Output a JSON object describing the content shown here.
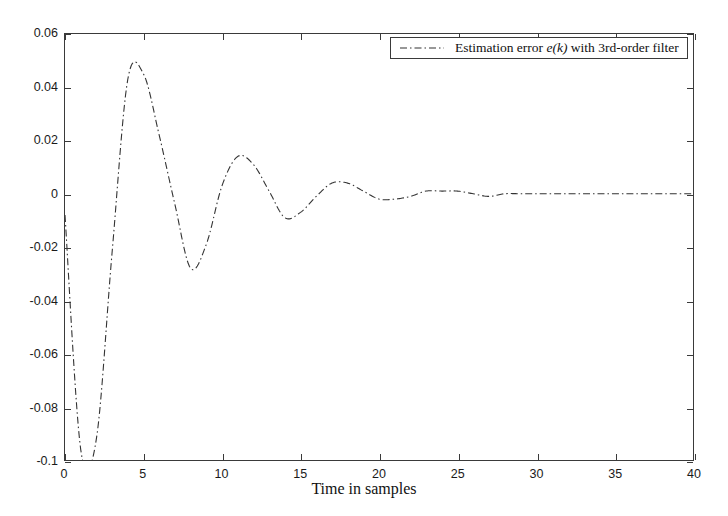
{
  "chart_data": {
    "type": "line",
    "title": "",
    "xlabel": "Time in samples",
    "ylabel": "",
    "xlim": [
      0,
      40
    ],
    "ylim": [
      -0.1,
      0.06
    ],
    "grid": false,
    "legend_position": "top-right",
    "line_style": "dash-dot",
    "line_color": "#333333",
    "background_color": "#ffffff",
    "axis_color": "#3a3a3a",
    "xticks": [
      0,
      5,
      10,
      15,
      20,
      25,
      30,
      35,
      40
    ],
    "xtick_labels": [
      "0",
      "5",
      "10",
      "15",
      "20",
      "25",
      "30",
      "35",
      "40"
    ],
    "yticks": [
      0.06,
      0.04,
      0.02,
      0,
      -0.02,
      -0.04,
      -0.06,
      -0.08,
      -0.1
    ],
    "ytick_labels": [
      "0.06",
      "0.04",
      "0.02",
      "0",
      "-0.02",
      "-0.04",
      "-0.06",
      "-0.08",
      "-0.1"
    ],
    "series": [
      {
        "name": "Estimation error e(k) with 3rd-order filter",
        "x": [
          0,
          1,
          2,
          3,
          4,
          5,
          6,
          7,
          8,
          9,
          10,
          11,
          12,
          13,
          14,
          15,
          16,
          17,
          18,
          19,
          20,
          21,
          22,
          23,
          24,
          25,
          26,
          27,
          28,
          29,
          30,
          31,
          32,
          33,
          34,
          35,
          36,
          37,
          38,
          39,
          40
        ],
        "values": [
          -0.008,
          -0.096,
          -0.092,
          -0.022,
          0.043,
          0.045,
          0.022,
          -0.004,
          -0.028,
          -0.019,
          0.003,
          0.014,
          0.011,
          0.001,
          -0.009,
          -0.007,
          -0.001,
          0.004,
          0.004,
          0.001,
          -0.002,
          -0.002,
          -0.001,
          0.001,
          0.001,
          0.001,
          0.0,
          -0.001,
          0.0,
          0.0,
          0.0,
          0.0,
          0.0,
          0.0,
          0.0,
          0.0,
          0.0,
          0.0,
          0.0,
          0.0,
          0.0
        ]
      }
    ],
    "legend": [
      {
        "label_prefix": "Estimation error ",
        "label_var": "e(k)",
        "label_suffix": " with 3rd-order filter",
        "full_label": "Estimation error e(k) with 3rd-order filter",
        "style": "dash-dot"
      }
    ]
  }
}
